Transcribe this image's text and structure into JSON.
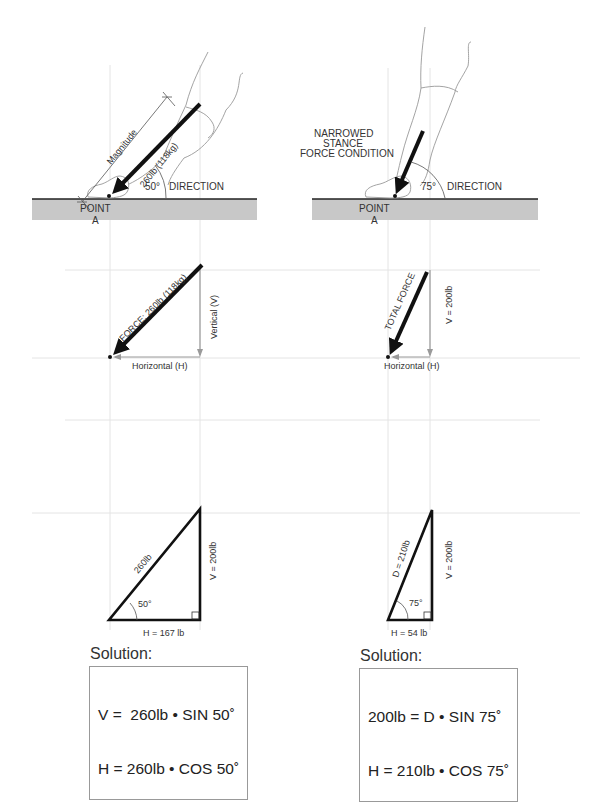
{
  "left_panel": {
    "force_diagram": {
      "magnitude_label": "Magnitude",
      "force_label": "260lb (118kg)",
      "angle_label": "50°",
      "direction_label": "DIRECTION",
      "point_label_line1": "POINT",
      "point_label_line2": "A"
    },
    "vector_diagram": {
      "force_label": "FORCE: 260lb (118kg)",
      "vertical_label": "Vertical (V)",
      "horizontal_label": "Horizontal (H)"
    },
    "triangle": {
      "hypotenuse_label": "260lb",
      "vertical_label": "V = 200lb",
      "horizontal_label": "H = 167 lb",
      "angle_label": "50°"
    },
    "solution": {
      "title": "Solution:",
      "line1": "V =  260lb • SIN 50˚",
      "line2": "H = 260lb • COS 50˚"
    }
  },
  "right_panel": {
    "force_diagram": {
      "condition_line1": "NARROWED",
      "condition_line2": "STANCE",
      "condition_line3": "FORCE CONDITION",
      "angle_label": "75°",
      "direction_label": "DIRECTION",
      "point_label_line1": "POINT",
      "point_label_line2": "A"
    },
    "vector_diagram": {
      "force_label": "TOTAL FORCE",
      "vertical_label": "V = 200lb",
      "horizontal_label": "Horizontal (H)"
    },
    "triangle": {
      "hypotenuse_label": "D = 210lb",
      "vertical_label": "V = 200lb",
      "horizontal_label": "H =  54 lb",
      "angle_label": "75°"
    },
    "solution": {
      "title": "Solution:",
      "line1": "200lb = D • SIN 75˚",
      "line2": "H = 210lb • COS 75˚"
    }
  },
  "colors": {
    "ground": "#c8c8c8",
    "guide_line": "#e4e4e4",
    "arrow": "#111111",
    "component_arrow": "#9a9a9a",
    "outline": "#888888"
  }
}
